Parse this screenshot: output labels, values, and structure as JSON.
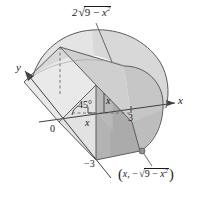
{
  "figure": {
    "name": "solid-with-square-cross-sections",
    "background_color": "#ffffff",
    "stroke_color": "#4a4a4a",
    "label_color": "#1a1a1a"
  },
  "colors": {
    "surface_light": "#e6e6e6",
    "surface_mid": "#d2d2d2",
    "surface_dark": "#b9b9b9",
    "surface_darkest": "#a9a9a9",
    "base_pale": "#efefef",
    "outline": "#595959",
    "dashed": "#6e6e6e",
    "point": "#8c8c8c"
  },
  "labels": {
    "top_expression": {
      "text": "2√(9 − x²)",
      "coefficient": "2",
      "radicand_main": "9 − ",
      "radicand_var": "x",
      "radicand_exp": "2"
    },
    "y_axis": "y",
    "x_axis": "x",
    "origin": "0",
    "angle": "45°",
    "tick_positive": "3",
    "tick_negative": "−3",
    "height_label": "x",
    "depth_label": "x",
    "point_expression": {
      "open_paren": "(",
      "first_coord": "x",
      "comma": ", ",
      "minus": "−",
      "radicand_main": "9 − ",
      "radicand_var": "x",
      "radicand_exp": "2",
      "close_paren": ")"
    }
  },
  "geometry": {
    "radius": 3,
    "cross_section_angle_degrees": 45,
    "cross_section_shape": "square",
    "base_region": "semicircle y = -sqrt(9 - x^2)",
    "top_edge_length": "2*sqrt(9 - x^2)"
  }
}
